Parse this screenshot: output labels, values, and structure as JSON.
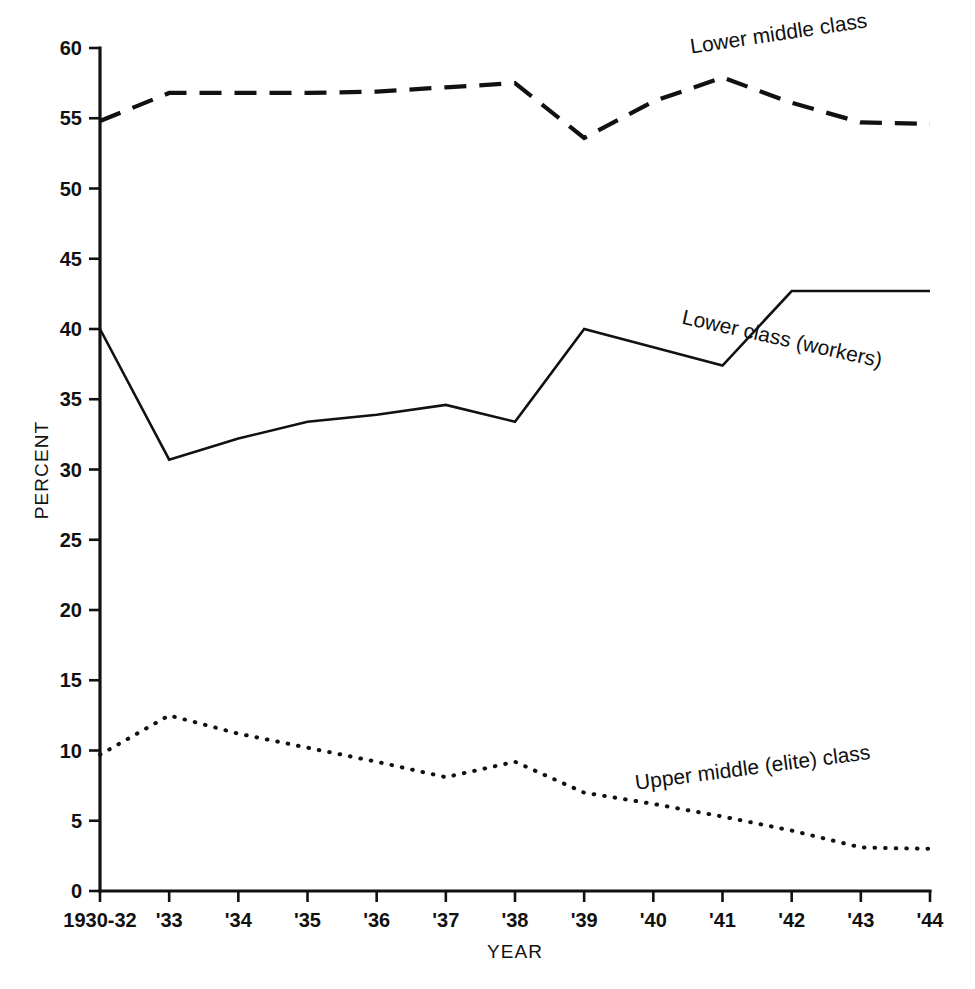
{
  "chart_data": {
    "type": "line",
    "title": "",
    "xlabel": "YEAR",
    "ylabel": "PERCENT",
    "grid": false,
    "legend_position": "inline-labels",
    "categories": [
      "1930-32",
      "'33",
      "'34",
      "'35",
      "'36",
      "'37",
      "'38",
      "'39",
      "'40",
      "'41",
      "'42",
      "'43",
      "'44"
    ],
    "x_tick_labels": [
      "1930-32",
      "'33",
      "'34",
      "'35",
      "'36",
      "'37",
      "'38",
      "'39",
      "'40",
      "'41",
      "'42",
      "'43",
      "'44"
    ],
    "y_tick_labels": [
      "0",
      "5",
      "10",
      "15",
      "20",
      "25",
      "30",
      "35",
      "40",
      "45",
      "50",
      "55",
      "60"
    ],
    "y_ticks": [
      0,
      5,
      10,
      15,
      20,
      25,
      30,
      35,
      40,
      45,
      50,
      55,
      60
    ],
    "ylim": [
      0,
      60
    ],
    "xlim": [
      0,
      12
    ],
    "series": [
      {
        "name": "Lower middle class",
        "style": "dashed",
        "label": "Lower middle class",
        "label_rotation": 8.5,
        "values": [
          54.8,
          56.8,
          56.8,
          56.8,
          56.9,
          57.2,
          57.5,
          53.6,
          56.2,
          57.9,
          56.1,
          54.7,
          54.6
        ]
      },
      {
        "name": "Lower class (workers)",
        "style": "solid",
        "label": "Lower class (workers)",
        "label_rotation": -12.5,
        "values": [
          40.0,
          30.7,
          32.2,
          33.4,
          33.9,
          34.6,
          33.4,
          40.0,
          38.7,
          37.4,
          42.7,
          42.7,
          42.7
        ]
      },
      {
        "name": "Upper middle (elite) class",
        "style": "dotted",
        "label": "Upper middle (elite) class",
        "label_rotation": 7.5,
        "values": [
          9.7,
          12.5,
          11.2,
          10.2,
          9.2,
          8.1,
          9.2,
          7.0,
          6.2,
          5.3,
          4.3,
          3.1,
          3.0
        ]
      }
    ],
    "series_label_anchors": [
      {
        "x_index": 8.55,
        "y_value": 59.6
      },
      {
        "x_index": 8.4,
        "y_value": 40.4
      },
      {
        "x_index": 7.75,
        "y_value": 7.2
      }
    ]
  },
  "axes": {
    "y_axis_title": "PERCENT",
    "x_axis_title": "YEAR"
  }
}
